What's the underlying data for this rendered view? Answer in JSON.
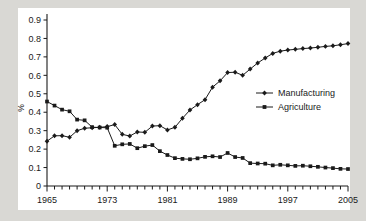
{
  "chart_data": {
    "type": "line",
    "title": "",
    "subtitle": "",
    "xlabel": "",
    "ylabel": "%",
    "xlim": [
      1965,
      2005
    ],
    "ylim": [
      0,
      0.9
    ],
    "grid": false,
    "legend_position": "center-right",
    "x_tick_labels": [
      "1965",
      "1973",
      "1981",
      "1989",
      "1997",
      "2005"
    ],
    "x_tick_values": [
      1965,
      1973,
      1981,
      1989,
      1997,
      2005
    ],
    "x_minor_tick_step": 1,
    "y_tick_labels": [
      "0",
      "0.1",
      "0.2",
      "0.3",
      "0.4",
      "0.5",
      "0.6",
      "0.7",
      "0.8",
      "0.9"
    ],
    "y_tick_values": [
      0,
      0.1,
      0.2,
      0.3,
      0.4,
      0.5,
      0.6,
      0.7,
      0.8,
      0.9
    ],
    "x": [
      1965,
      1966,
      1967,
      1968,
      1969,
      1970,
      1971,
      1972,
      1973,
      1974,
      1975,
      1976,
      1977,
      1978,
      1979,
      1980,
      1981,
      1982,
      1983,
      1984,
      1985,
      1986,
      1987,
      1988,
      1989,
      1990,
      1991,
      1992,
      1993,
      1994,
      1995,
      1996,
      1997,
      1998,
      1999,
      2000,
      2001,
      2002,
      2003,
      2004,
      2005
    ],
    "series": [
      {
        "name": "Manufacturing",
        "marker": "diamond",
        "color": "#1a1a1a",
        "values": [
          0.243,
          0.272,
          0.273,
          0.264,
          0.3,
          0.313,
          0.316,
          0.318,
          0.322,
          0.333,
          0.28,
          0.271,
          0.293,
          0.291,
          0.325,
          0.327,
          0.304,
          0.318,
          0.367,
          0.412,
          0.441,
          0.468,
          0.536,
          0.57,
          0.615,
          0.617,
          0.6,
          0.634,
          0.667,
          0.694,
          0.719,
          0.731,
          0.737,
          0.741,
          0.745,
          0.748,
          0.752,
          0.757,
          0.76,
          0.766,
          0.772
        ]
      },
      {
        "name": "Agriculture",
        "marker": "square",
        "color": "#1a1a1a",
        "values": [
          0.458,
          0.436,
          0.414,
          0.405,
          0.36,
          0.356,
          0.319,
          0.317,
          0.316,
          0.218,
          0.226,
          0.228,
          0.205,
          0.216,
          0.222,
          0.189,
          0.168,
          0.151,
          0.147,
          0.145,
          0.15,
          0.158,
          0.161,
          0.157,
          0.179,
          0.157,
          0.152,
          0.124,
          0.122,
          0.121,
          0.112,
          0.115,
          0.112,
          0.109,
          0.11,
          0.107,
          0.104,
          0.1,
          0.097,
          0.093,
          0.092
        ]
      }
    ]
  },
  "legend": {
    "entries": [
      {
        "label": "Manufacturing",
        "marker": "diamond"
      },
      {
        "label": "Agriculture",
        "marker": "square"
      }
    ]
  },
  "axes": {
    "y_axis_title": "%"
  }
}
